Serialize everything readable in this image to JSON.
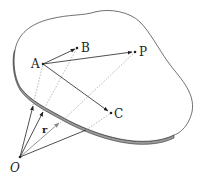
{
  "diagram": {
    "labels": {
      "A": "A",
      "B": "B",
      "P": "P",
      "C": "C",
      "O": "O",
      "r": "r"
    },
    "points": {
      "A": [
        43,
        64
      ],
      "B": [
        77,
        48
      ],
      "P": [
        135,
        52
      ],
      "C": [
        111,
        113
      ],
      "O": [
        20,
        157
      ]
    },
    "colors": {
      "outline": "#333333",
      "edge_fill": "#999999",
      "arrow": "#222222",
      "arrow_gray": "#888888",
      "dotted": "#999999"
    }
  }
}
